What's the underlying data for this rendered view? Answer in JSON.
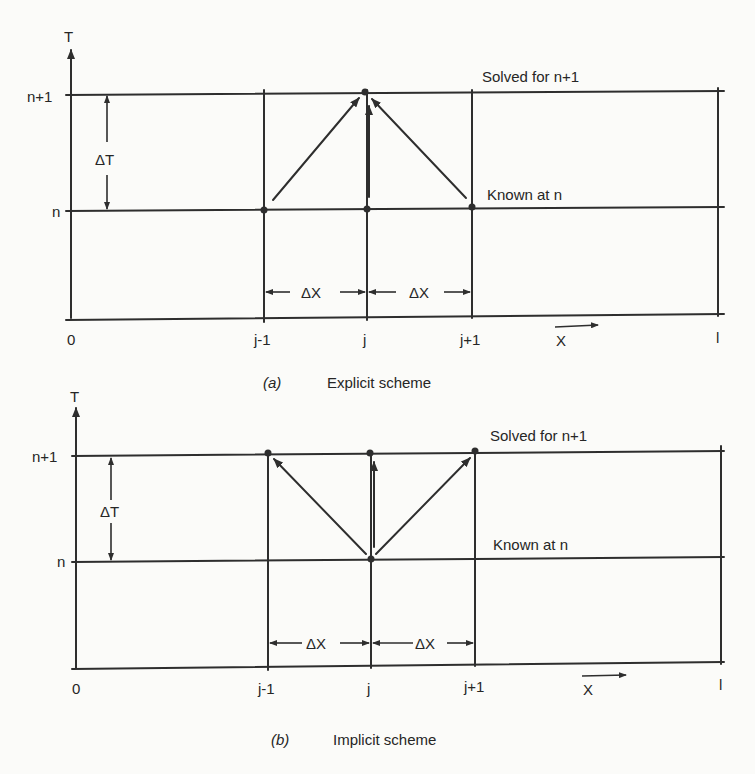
{
  "figure": {
    "panels": [
      {
        "id": "a",
        "caption_letter": "(a)",
        "caption_text": "Explicit scheme",
        "y_axis_label": "T",
        "y_ticks": [
          "n+1",
          "n"
        ],
        "x_ticks": [
          "0",
          "j-1",
          "j",
          "j+1",
          "l"
        ],
        "x_axis_label": "X",
        "dt_label": "ΔT",
        "dx_labels": [
          "ΔX",
          "ΔX"
        ],
        "top_row_label": "Solved for n+1",
        "bottom_row_label": "Known at n",
        "arrows": [
          {
            "from": "(j-1, n)",
            "to": "(j, n+1)"
          },
          {
            "from": "(j, n)",
            "to": "(j, n+1)"
          },
          {
            "from": "(j+1, n)",
            "to": "(j, n+1)"
          }
        ]
      },
      {
        "id": "b",
        "caption_letter": "(b)",
        "caption_text": "Implicit scheme",
        "y_axis_label": "T",
        "y_ticks": [
          "n+1",
          "n"
        ],
        "x_ticks": [
          "0",
          "j-1",
          "j",
          "j+1",
          "l"
        ],
        "x_axis_label": "X",
        "dt_label": "ΔT",
        "dx_labels": [
          "ΔX",
          "ΔX"
        ],
        "top_row_label": "Solved for n+1",
        "bottom_row_label": "Known at n",
        "arrows": [
          {
            "from": "(j, n)",
            "to": "(j-1, n+1)"
          },
          {
            "from": "(j, n)",
            "to": "(j, n+1)"
          },
          {
            "from": "(j, n)",
            "to": "(j+1, n+1)"
          }
        ]
      }
    ],
    "colors": {
      "ink": "#2e2e2e",
      "paper": "#fbfbf9"
    }
  }
}
